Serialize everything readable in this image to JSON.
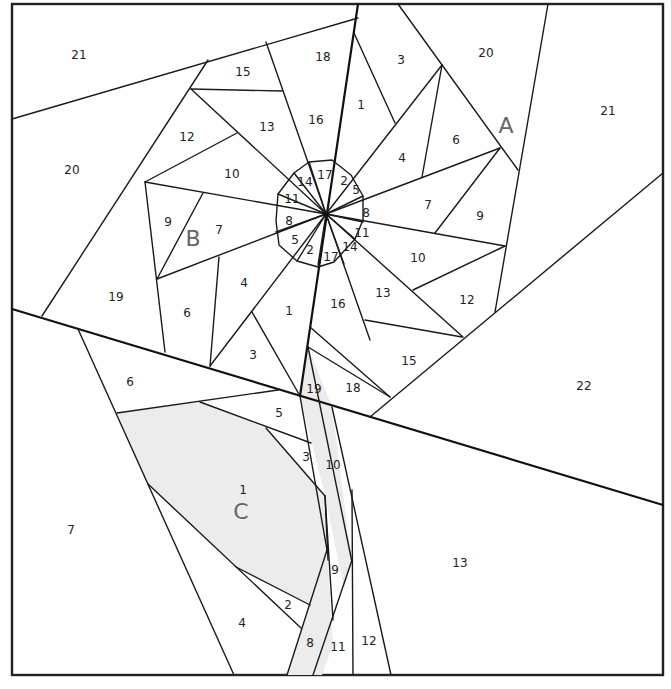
{
  "diagram": {
    "type": "foundation-paper-piecing-pattern",
    "canvas": {
      "width": 671,
      "height": 689
    },
    "colors": {
      "line": "#1a1a1a",
      "background": "#ffffff",
      "shaded_fill": "#ececec",
      "section_label": "#666666"
    },
    "sections": [
      {
        "id": "A",
        "label": "A",
        "x": 506,
        "y": 127
      },
      {
        "id": "B",
        "label": "B",
        "x": 193,
        "y": 240
      },
      {
        "id": "C",
        "label": "C",
        "x": 241,
        "y": 513
      }
    ],
    "section_a": {
      "pieces": [
        {
          "n": "1",
          "x": 361,
          "y": 105
        },
        {
          "n": "2",
          "x": 344,
          "y": 181
        },
        {
          "n": "3",
          "x": 401,
          "y": 60
        },
        {
          "n": "4",
          "x": 402,
          "y": 158
        },
        {
          "n": "5",
          "x": 356,
          "y": 190
        },
        {
          "n": "6",
          "x": 456,
          "y": 140
        },
        {
          "n": "7",
          "x": 428,
          "y": 205
        },
        {
          "n": "8",
          "x": 366,
          "y": 213
        },
        {
          "n": "9",
          "x": 480,
          "y": 216
        },
        {
          "n": "10",
          "x": 418,
          "y": 258
        },
        {
          "n": "11",
          "x": 362,
          "y": 233
        },
        {
          "n": "12",
          "x": 467,
          "y": 300
        },
        {
          "n": "13",
          "x": 383,
          "y": 293
        },
        {
          "n": "14",
          "x": 350,
          "y": 247
        },
        {
          "n": "15",
          "x": 409,
          "y": 361
        },
        {
          "n": "16",
          "x": 338,
          "y": 304
        },
        {
          "n": "17",
          "x": 331,
          "y": 257
        },
        {
          "n": "18",
          "x": 353,
          "y": 388
        },
        {
          "n": "20",
          "x": 486,
          "y": 53
        },
        {
          "n": "21",
          "x": 608,
          "y": 111
        },
        {
          "n": "22",
          "x": 584,
          "y": 386
        }
      ]
    },
    "section_b": {
      "pieces": [
        {
          "n": "1",
          "x": 289,
          "y": 311
        },
        {
          "n": "2",
          "x": 310,
          "y": 250
        },
        {
          "n": "3",
          "x": 253,
          "y": 355
        },
        {
          "n": "4",
          "x": 244,
          "y": 283
        },
        {
          "n": "5",
          "x": 295,
          "y": 240
        },
        {
          "n": "6",
          "x": 187,
          "y": 313
        },
        {
          "n": "7",
          "x": 219,
          "y": 230
        },
        {
          "n": "8",
          "x": 289,
          "y": 221
        },
        {
          "n": "9",
          "x": 168,
          "y": 222
        },
        {
          "n": "10",
          "x": 232,
          "y": 174
        },
        {
          "n": "11",
          "x": 292,
          "y": 199
        },
        {
          "n": "12",
          "x": 187,
          "y": 137
        },
        {
          "n": "13",
          "x": 267,
          "y": 127
        },
        {
          "n": "14",
          "x": 305,
          "y": 182
        },
        {
          "n": "15",
          "x": 243,
          "y": 72
        },
        {
          "n": "16",
          "x": 316,
          "y": 120
        },
        {
          "n": "17",
          "x": 325,
          "y": 175
        },
        {
          "n": "18",
          "x": 323,
          "y": 57
        },
        {
          "n": "19",
          "x": 116,
          "y": 297
        },
        {
          "n": "20",
          "x": 72,
          "y": 170
        },
        {
          "n": "21",
          "x": 79,
          "y": 55
        }
      ]
    },
    "section_c": {
      "pieces": [
        {
          "n": "1",
          "x": 243,
          "y": 490
        },
        {
          "n": "2",
          "x": 288,
          "y": 605
        },
        {
          "n": "3",
          "x": 306,
          "y": 457
        },
        {
          "n": "4",
          "x": 242,
          "y": 623
        },
        {
          "n": "5",
          "x": 279,
          "y": 413
        },
        {
          "n": "6",
          "x": 130,
          "y": 382
        },
        {
          "n": "7",
          "x": 71,
          "y": 530
        },
        {
          "n": "8",
          "x": 310,
          "y": 643
        },
        {
          "n": "9",
          "x": 335,
          "y": 570
        },
        {
          "n": "10",
          "x": 333,
          "y": 465
        },
        {
          "n": "11",
          "x": 338,
          "y": 647
        },
        {
          "n": "12",
          "x": 369,
          "y": 641
        },
        {
          "n": "13",
          "x": 460,
          "y": 563
        },
        {
          "n": "19",
          "x": 314,
          "y": 389
        }
      ]
    }
  }
}
